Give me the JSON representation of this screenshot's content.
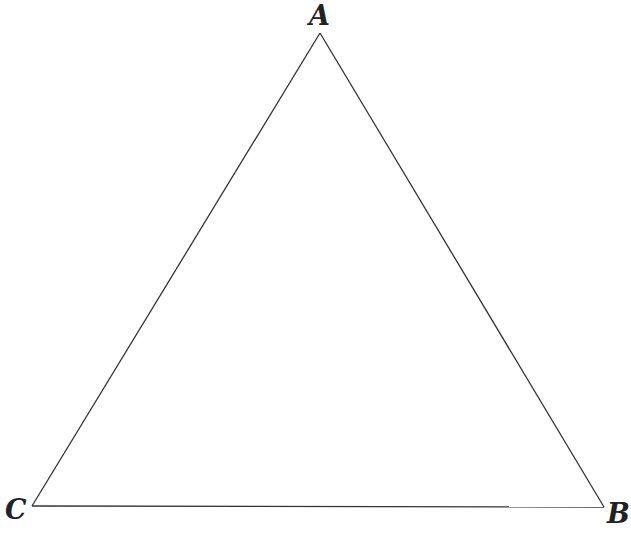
{
  "diagram": {
    "type": "triangle",
    "stroke_color": "#333333",
    "background": "#ffffff",
    "vertices": [
      {
        "label": "A",
        "x": 320,
        "y": 33
      },
      {
        "label": "B",
        "x": 604,
        "y": 507
      },
      {
        "label": "C",
        "x": 32,
        "y": 506
      }
    ],
    "labels": {
      "a": "A",
      "b": "B",
      "c": "C"
    }
  }
}
